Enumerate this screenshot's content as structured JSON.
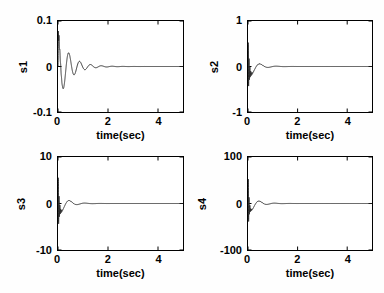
{
  "figure": {
    "background": "#fefefe",
    "axis_color": "#000000",
    "line_color": "#2a2a2a",
    "text_color": "#000000",
    "grid": "off",
    "legend": "none",
    "layout": "2x2 subplots"
  },
  "chart_data": [
    {
      "type": "line",
      "title": "",
      "ylabel": "s1",
      "xlabel": "time(sec)",
      "xlim": [
        0,
        5
      ],
      "ylim": [
        -0.1,
        0.1
      ],
      "xticks": [
        0,
        2,
        4
      ],
      "xtick_labels": [
        "0",
        "2",
        "4"
      ],
      "yticks_top_to_bottom": [
        0.1,
        0,
        -0.1
      ],
      "ytick_labels": [
        "0.1",
        "0",
        "-0.1"
      ],
      "signal": {
        "model": "sum of exponentially damped sinusoids, settles to 0",
        "attack_s": 0.015,
        "components": [
          {
            "amplitude": 0.078,
            "freq_hz": 2.3,
            "decay_tau_s": 0.45,
            "phase_rad": 1.5708
          },
          {
            "amplitude": 0.02,
            "freq_hz": 30,
            "decay_tau_s": 0.05,
            "phase_rad": 0
          }
        ]
      },
      "keypoints_t_y": [
        [
          0,
          0
        ],
        [
          0.03,
          0.075
        ],
        [
          0.2,
          -0.06
        ],
        [
          0.43,
          0.03
        ],
        [
          0.62,
          -0.018
        ],
        [
          0.85,
          0.01
        ],
        [
          1.5,
          0
        ],
        [
          5,
          0
        ]
      ]
    },
    {
      "type": "line",
      "title": "",
      "ylabel": "s2",
      "xlabel": "time(sec)",
      "xlim": [
        0,
        5
      ],
      "ylim": [
        -1,
        1
      ],
      "xticks": [
        0,
        2,
        4
      ],
      "xtick_labels": [
        "0",
        "2",
        "4"
      ],
      "yticks_top_to_bottom": [
        1,
        0,
        -1
      ],
      "ytick_labels": [
        "1",
        "0",
        "-1"
      ],
      "signal": {
        "model": "fast decaying chatter plus damped oscillation, settles to 0",
        "attack_s": 0,
        "components": [
          {
            "amplitude": 0.26,
            "freq_hz": 1.5,
            "decay_tau_s": 0.32,
            "phase_rad": 3.1416
          },
          {
            "amplitude": 0.65,
            "freq_hz": 30,
            "decay_tau_s": 0.045,
            "phase_rad": 0
          }
        ]
      },
      "keypoints_t_y": [
        [
          0,
          0
        ],
        [
          0.01,
          0.6
        ],
        [
          0.03,
          -0.4
        ],
        [
          0.3,
          -0.2
        ],
        [
          0.55,
          0.1
        ],
        [
          1.2,
          0
        ],
        [
          5,
          0
        ]
      ]
    },
    {
      "type": "line",
      "title": "",
      "ylabel": "s3",
      "xlabel": "time(sec)",
      "xlim": [
        0,
        5
      ],
      "ylim": [
        -10,
        10
      ],
      "xticks": [
        0,
        2,
        4
      ],
      "xtick_labels": [
        "0",
        "2",
        "4"
      ],
      "yticks_top_to_bottom": [
        10,
        0,
        -10
      ],
      "ytick_labels": [
        "10",
        "0",
        "-10"
      ],
      "signal": {
        "model": "fast decaying spike plus damped oscillation, settles to 0",
        "attack_s": 0,
        "components": [
          {
            "amplitude": 2.6,
            "freq_hz": 1.6,
            "decay_tau_s": 0.32,
            "phase_rad": 3.1416
          },
          {
            "amplitude": 7.0,
            "freq_hz": 30,
            "decay_tau_s": 0.04,
            "phase_rad": 0
          }
        ]
      },
      "keypoints_t_y": [
        [
          0,
          0
        ],
        [
          0.02,
          6.3
        ],
        [
          0.05,
          -3.5
        ],
        [
          0.25,
          -1.8
        ],
        [
          0.45,
          0.9
        ],
        [
          1.2,
          0
        ],
        [
          5,
          0
        ]
      ]
    },
    {
      "type": "line",
      "title": "",
      "ylabel": "s4",
      "xlabel": "time(sec)",
      "xlim": [
        0,
        5
      ],
      "ylim": [
        -100,
        100
      ],
      "xticks": [
        0,
        2,
        4
      ],
      "xtick_labels": [
        "0",
        "2",
        "4"
      ],
      "yticks_top_to_bottom": [
        100,
        0,
        -100
      ],
      "ytick_labels": [
        "100",
        "0",
        "-100"
      ],
      "signal": {
        "model": "fast decaying spike plus damped oscillation, settles to 0",
        "attack_s": 0,
        "components": [
          {
            "amplitude": 22,
            "freq_hz": 1.6,
            "decay_tau_s": 0.32,
            "phase_rad": 3.1416
          },
          {
            "amplitude": 68,
            "freq_hz": 30,
            "decay_tau_s": 0.035,
            "phase_rad": 0
          }
        ]
      },
      "keypoints_t_y": [
        [
          0,
          0
        ],
        [
          0.02,
          58
        ],
        [
          0.05,
          -30
        ],
        [
          0.25,
          -12
        ],
        [
          0.5,
          7
        ],
        [
          1.2,
          0
        ],
        [
          5,
          0
        ]
      ]
    }
  ]
}
